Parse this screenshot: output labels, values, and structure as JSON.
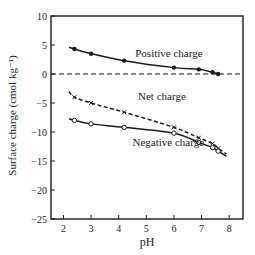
{
  "chart_data": {
    "type": "line",
    "title": "",
    "xlabel": "pH",
    "ylabel": "Surface charge (cmol kg⁻¹)",
    "xlim": [
      1.55,
      8.5
    ],
    "ylim": [
      -25,
      10
    ],
    "xticks": [
      2,
      3,
      4,
      5,
      6,
      7,
      8
    ],
    "yticks": [
      10,
      5,
      0,
      -5,
      -10,
      -15,
      -20,
      -25
    ],
    "grid": false,
    "legend": "inline labels",
    "reference_line": {
      "y": 0,
      "style": "dashed"
    },
    "series": [
      {
        "name": "Positive charge",
        "marker": "filled-circle",
        "line": "solid",
        "label_pos": [
          4.6,
          2.9
        ],
        "x": [
          2.2,
          2.4,
          3.0,
          4.2,
          6.0,
          6.9,
          7.4,
          7.6
        ],
        "y": [
          4.6,
          4.3,
          3.5,
          2.3,
          1.1,
          0.8,
          0.3,
          0.0
        ],
        "marker_idx": [
          1,
          2,
          3,
          4,
          5,
          6,
          7
        ]
      },
      {
        "name": "Net charge",
        "marker": "cross",
        "line": "dashed",
        "label_pos": [
          4.7,
          -4.4
        ],
        "x": [
          2.2,
          2.4,
          3.0,
          4.2,
          6.0,
          6.9,
          7.4,
          7.6,
          7.9
        ],
        "y": [
          -3.0,
          -4.0,
          -5.0,
          -6.6,
          -9.2,
          -11.0,
          -12.0,
          -12.8,
          -13.8
        ],
        "marker_idx": [
          1,
          2,
          3,
          4,
          5,
          6,
          7
        ]
      },
      {
        "name": "Negative charge",
        "marker": "open-circle",
        "line": "solid",
        "label_pos": [
          4.5,
          -12.4
        ],
        "x": [
          2.2,
          2.4,
          3.0,
          4.2,
          6.0,
          6.9,
          7.4,
          7.6,
          7.9
        ],
        "y": [
          -7.7,
          -8.0,
          -8.6,
          -9.2,
          -10.2,
          -11.8,
          -12.7,
          -13.3,
          -14.2
        ],
        "marker_idx": [
          1,
          2,
          3,
          4,
          5,
          6,
          7
        ]
      }
    ]
  }
}
